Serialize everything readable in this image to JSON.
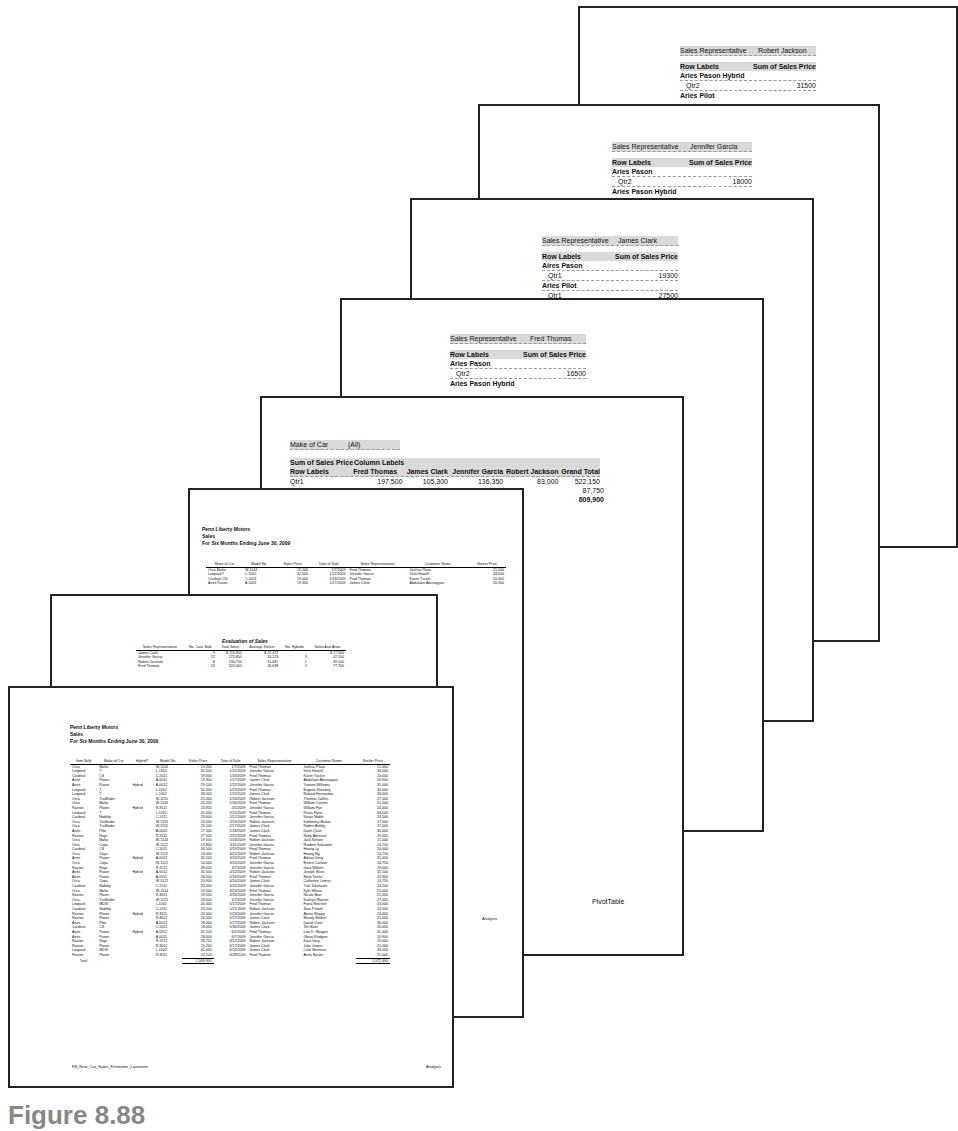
{
  "pages": {
    "robert_jackson": {
      "filter_label": "Sales Representative",
      "filter_value": "Robert Jackson",
      "row_labels": "Row Labels",
      "value_header": "Sum of Sales Price",
      "rows": [
        {
          "label": "Aries Pason Hybrid",
          "bold": true,
          "value": ""
        },
        {
          "label": "Qtr2",
          "bold": false,
          "value": "31500"
        },
        {
          "label": "Aries Pilot",
          "bold": true,
          "value": ""
        }
      ],
      "footer": "Robert Jackson"
    },
    "jennifer_garcia": {
      "filter_label": "Sales Representative",
      "filter_value": "Jennifer Garcia",
      "row_labels": "Row Labels",
      "value_header": "Sum of Sales Price",
      "rows": [
        {
          "label": "Aries Pason",
          "bold": true,
          "value": ""
        },
        {
          "label": "Qtr2",
          "bold": false,
          "value": "18000"
        },
        {
          "label": "Aries Pason Hybrid",
          "bold": true,
          "value": ""
        }
      ],
      "footer": "Jennifer Garcia"
    },
    "james_clark": {
      "filter_label": "Sales Representative",
      "filter_value": "James Clark",
      "row_labels": "Row Labels",
      "value_header": "Sum of Sales Price",
      "rows": [
        {
          "label": "Aires Pason",
          "bold": true,
          "value": ""
        },
        {
          "label": "Qtr1",
          "bold": false,
          "value": "19300"
        },
        {
          "label": "Aries Pilot",
          "bold": true,
          "value": ""
        },
        {
          "label": "Qtr1",
          "bold": false,
          "value": "27500"
        }
      ],
      "footer": "James Clark"
    },
    "fred_thomas": {
      "filter_label": "Sales Representative",
      "filter_value": "Fred Thomas",
      "row_labels": "Row Labels",
      "value_header": "Sum of Sales Price",
      "rows": [
        {
          "label": "Aries Pason",
          "bold": true,
          "value": ""
        },
        {
          "label": "Qtr2",
          "bold": false,
          "value": "16500"
        },
        {
          "label": "Aries Pason Hybrid",
          "bold": true,
          "value": ""
        }
      ],
      "footer": "Fred Thomas"
    },
    "pivot": {
      "filter_label": "Make of Car",
      "filter_value": "(All)",
      "value_label": "Sum of Sales Price",
      "column_labels": "Column Labels",
      "row_labels": "Row Labels",
      "columns": [
        "Fred Thomas",
        "James Clark",
        "Jennifer Garcia",
        "Robert Jackson",
        "Grand Total"
      ],
      "rows": [
        {
          "label": "Qtr1",
          "values": [
            "197,500",
            "105,300",
            "136,350",
            "83,000",
            "522,150"
          ]
        },
        {
          "label": "",
          "values": [
            "",
            "",
            "",
            "",
            "87,750"
          ]
        },
        {
          "label": "",
          "values": [
            "",
            "",
            "",
            "",
            "609,900"
          ]
        }
      ],
      "footer": "PivotTable"
    },
    "sorted_sales": {
      "company": "Penn Liberty Motors",
      "title": "Sales",
      "period": "For Six Months Ending June 30, 2009",
      "headers": [
        "Make of Car",
        "Model No.",
        "Sales Price",
        "Date of Sale",
        "Sales Representative",
        "Customer Name",
        "Sticker Price"
      ],
      "rows": [
        [
          "Orca Malto",
          "W-1144",
          "19,200",
          "1/7/2009",
          "Fred Thomas",
          "Joshua Plaza",
          "21,000"
        ],
        [
          "Leopard T",
          "L-1052",
          "32,500",
          "1/12/2009",
          "Jennifer Garcia",
          "Vicki Howell",
          "34,000"
        ],
        [
          "Cardinal CS",
          "C-5011",
          "19,000",
          "1/16/2009",
          "Fred Thomas",
          "Karen Tucker",
          "20,000"
        ],
        [
          "Aires Pason",
          "A-0011",
          "19,300",
          "1/17/2009",
          "James Clark",
          "Abdulaziz Abunayyan",
          "20,900"
        ]
      ],
      "footer": "Analysis"
    },
    "evaluation": {
      "title": "Evaluation of Sales",
      "headers": [
        "Sales Representative",
        "No. Cars Sold",
        "Total Sales",
        "Average Sticker",
        "No. Hybrids",
        "Sales Asst Arias"
      ],
      "rows": [
        [
          "James Clark",
          "9",
          "$ 116,850",
          "$ 25,472",
          "-",
          "$ 17,500"
        ],
        [
          "Jennifer Garcia",
          "12",
          "273,850",
          "24,123",
          "3",
          "47,100"
        ],
        [
          "Robert Jackson",
          "8",
          "194,750",
          "25,681",
          "1",
          "39,500"
        ],
        [
          "Fred Thomas",
          "13",
          "324,400",
          "26,638",
          "2",
          "77,700"
        ]
      ]
    },
    "front": {
      "company": "Penn Liberty Motors",
      "title": "Sales",
      "period": "For Six Months Ending June 30, 2009",
      "headers": [
        "Item Sold",
        "Make of Car",
        "Hybrid?",
        "Model No.",
        "Sales Price",
        "Date of Sale",
        "Sales Representative",
        "Customer Name",
        "Sticker Price"
      ],
      "rows": [
        [
          "Orca",
          "Malto",
          "",
          "W-1144",
          "19,200",
          "1/7/2009",
          "Fred Thomas",
          "Joshua Plaza",
          "21,000"
        ],
        [
          "Leopard",
          "T",
          "",
          "L-1052",
          "32,500",
          "1/12/2009",
          "Jennifer Garcia",
          "Vicki Howell",
          "34,000"
        ],
        [
          "Cardinal",
          "CS",
          "",
          "C-5011",
          "19,000",
          "1/16/2009",
          "Fred Thomas",
          "Karen Tucker",
          "20,000"
        ],
        [
          "Aires",
          "Pason",
          "",
          "A-0011",
          "19,300",
          "1/17/2009",
          "James Clark",
          "Abdulaziz Abunayyan",
          "20,900"
        ],
        [
          "Aries",
          "Pason",
          "Hybrid",
          "A-0012",
          "29,100",
          "1/22/2009",
          "Jennifer Garcia",
          "Yvonne Williams",
          "31,000"
        ],
        [
          "Leopard",
          "T",
          "",
          "L-1052",
          "32,000",
          "1/23/2009",
          "Fred Thomas",
          "Eugene Shockey",
          "34,000"
        ],
        [
          "Leopard",
          "T",
          "",
          "L-1052",
          "33,000",
          "1/23/2009",
          "James Clark",
          "Roland Hernandez",
          "34,000"
        ],
        [
          "Orca",
          "Trailfinder",
          "",
          "W-1155",
          "25,000",
          "1/26/2009",
          "Robert Jackson",
          "Thomas Collins",
          "27,000"
        ],
        [
          "Orca",
          "Malto",
          "",
          "W-1144",
          "20,250",
          "1/30/2009",
          "Fred Thomas",
          "William Conner",
          "21,000"
        ],
        [
          "Raston",
          "Plover",
          "Hybrid",
          "R-8111",
          "23,950",
          "2/5/2009",
          "Jennifer Garcia",
          "William Fye",
          "24,400"
        ],
        [
          "Leopard",
          "T",
          "",
          "L-1052",
          "31,000",
          "2/12/2009",
          "Fred Thomas",
          "Paula Flynn",
          "34,000"
        ],
        [
          "Cardinal",
          "Nobility",
          "",
          "C-5111",
          "23,000",
          "2/12/2009",
          "Jennifer Garcia",
          "Vivian Noble",
          "24,500"
        ],
        [
          "Orca",
          "Trailfinder",
          "",
          "W-1155",
          "24,500",
          "2/16/2009",
          "Robert Jackson",
          "Kimberley Barker",
          "27,000"
        ],
        [
          "Orca",
          "Trailfinder",
          "",
          "W-1155",
          "25,500",
          "2/17/2009",
          "James Clark",
          "Robert Ashby",
          "27,000"
        ],
        [
          "Aries",
          "Pilot",
          "",
          "A-0022",
          "27,500",
          "2/18/2009",
          "James Clark",
          "Danh Quan",
          "30,000"
        ],
        [
          "Raston",
          "Rays",
          "",
          "R-9211",
          "27,500",
          "2/22/2009",
          "Fred Thomas",
          "Ruby Atkinson",
          "29,000"
        ],
        [
          "Orca",
          "Malto",
          "",
          "W-1144",
          "19,500",
          "2/24/2009",
          "Robert Jackson",
          "Jack Nelson",
          "21,000"
        ],
        [
          "Orca",
          "Copa",
          "",
          "W-1122",
          "13,800",
          "3/11/2009",
          "Jennifer Garcia",
          "Rueben Salvatore",
          "14,750"
        ],
        [
          "Cardinal",
          "CS",
          "",
          "C-5011",
          "18,500",
          "3/19/2009",
          "Fred Thomas",
          "Hoang Ly",
          "20,000"
        ],
        [
          "Orca",
          "Copa",
          "",
          "W-1122",
          "14,000",
          "3/21/2009",
          "Robert Jackson",
          "Hoang Ng",
          "14,750"
        ],
        [
          "Aries",
          "Pason",
          "Hybrid",
          "A-0012",
          "30,100",
          "3/24/2009",
          "Fred Thomas",
          "Adrian Vang",
          "31,000"
        ],
        [
          "Orca",
          "Copa",
          "",
          "W-1122",
          "14,000",
          "3/25/2009",
          "Jennifer Garcia",
          "Ernest Carlson",
          "14,750"
        ],
        [
          "Raston",
          "Rays",
          "",
          "R-9211",
          "28,000",
          "4/7/2009",
          "Jennifer Garcia",
          "Gary Wilkins",
          "29,000"
        ],
        [
          "Aries",
          "Pason",
          "Hybrid",
          "A-0012",
          "31,500",
          "4/12/2009",
          "Robert Jackson",
          "Joseph Beez",
          "32,100"
        ],
        [
          "Aries",
          "Pason",
          "",
          "A-0011",
          "18,500",
          "4/16/2009",
          "Fred Thomas",
          "Mary Torres",
          "20,900"
        ],
        [
          "Orca",
          "Copa",
          "",
          "W-1122",
          "13,900",
          "4/20/2009",
          "James Clark",
          "Catherine Lemus",
          "14,750"
        ],
        [
          "Cardinal",
          "Nobility",
          "",
          "C-5111",
          "23,500",
          "4/20/2009",
          "Jennifer Garcia",
          "Yuki Takahashi",
          "24,500"
        ],
        [
          "Orca",
          "Malto",
          "",
          "W-1144",
          "19,200",
          "4/23/2009",
          "Fred Thomas",
          "Kyle Wilson",
          "21,000"
        ],
        [
          "Raston",
          "Plover",
          "",
          "R-8011",
          "19,500",
          "4/26/2009",
          "Jennifer Garcia",
          "Nicole Boer",
          "21,000"
        ],
        [
          "Orca",
          "Trailfinder",
          "",
          "W-1155",
          "24,000",
          "5/7/2009",
          "Jennifer Garcia",
          "Kathryn Warren",
          "27,000"
        ],
        [
          "Leopard",
          "MDXI",
          "",
          "L-1042",
          "40,000",
          "5/17/2009",
          "Fred Thomas",
          "Fiona Reichert",
          "43,000"
        ],
        [
          "Cardinal",
          "Nobility",
          "",
          "C-5111",
          "23,500",
          "5/21/2009",
          "Robert Jackson",
          "Sara Powell",
          "24,500"
        ],
        [
          "Raston",
          "Plover",
          "Hybrid",
          "R-8111",
          "24,000",
          "5/23/2009",
          "Jennifer Garcia",
          "Aaron Shippy",
          "24,400"
        ],
        [
          "Raston",
          "Plover",
          "",
          "R-8011",
          "18,500",
          "5/27/2009",
          "James Clark",
          "Mandy Walker",
          "21,000"
        ],
        [
          "Aries",
          "Pilot",
          "",
          "A-0022",
          "28,000",
          "5/27/2009",
          "Robert Jackson",
          "David Creel",
          "30,000"
        ],
        [
          "Cardinal",
          "CS",
          "",
          "C-5011",
          "18,000",
          "5/30/2009",
          "James Clark",
          "Teri Baer",
          "20,000"
        ],
        [
          "Aries",
          "Pason",
          "Hybrid",
          "A-0012",
          "31,100",
          "6/1/2009",
          "Fred Thomas",
          "Lisa D. Morgan",
          "31,000"
        ],
        [
          "Aries",
          "Pason",
          "",
          "A-0011",
          "18,000",
          "6/7/2009",
          "Jennifer Garcia",
          "Gloria Rodgers",
          "20,900"
        ],
        [
          "Raston",
          "Rays",
          "",
          "R-9211",
          "28,750",
          "6/12/2009",
          "Robert Jackson",
          "Kara Gray",
          "29,000"
        ],
        [
          "Raston",
          "Plover",
          "",
          "R-8011",
          "19,200",
          "6/17/2009",
          "James Clark",
          "Julie James",
          "21,000"
        ],
        [
          "Leopard",
          "MDXI",
          "",
          "L-1042",
          "42,000",
          "6/22/2009",
          "James Clark",
          "Luke Martinez",
          "43,000"
        ],
        [
          "Raston",
          "Plover",
          "",
          "R-8011",
          "20,100",
          "6/28/2009",
          "Fred Thomas",
          "Anita Barton",
          "21,000"
        ]
      ],
      "total_label": "Total",
      "total_sales": "1,009,900",
      "total_sticker": "1,072,400",
      "footer_left": "R8_New_Car_Sales_Firstname_Lastname",
      "footer_right": "Analysis"
    }
  },
  "figure_caption": "Figure 8.88"
}
